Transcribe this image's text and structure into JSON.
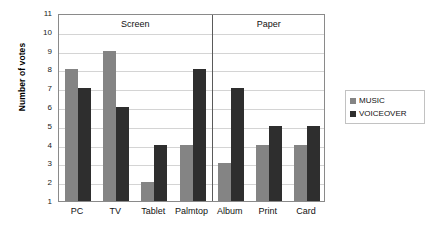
{
  "chart_data": {
    "type": "bar",
    "title": "",
    "xlabel": "",
    "ylabel": "Number of votes",
    "ylim": [
      1,
      11
    ],
    "ytick_step": 1,
    "yticks": [
      11,
      10,
      9,
      8,
      7,
      6,
      5,
      4,
      3,
      2,
      1
    ],
    "grid": true,
    "legend_position": "right",
    "categories": [
      "PC",
      "TV",
      "Tablet",
      "Palmtop",
      "Album",
      "Print",
      "Card"
    ],
    "groups": [
      {
        "label": "Screen",
        "categories": [
          "PC",
          "TV",
          "Tablet",
          "Palmtop"
        ]
      },
      {
        "label": "Paper",
        "categories": [
          "Album",
          "Print",
          "Card"
        ]
      }
    ],
    "series": [
      {
        "name": "MUSIC",
        "color": "#848484",
        "values": [
          8,
          9,
          2,
          4,
          3,
          4,
          4
        ]
      },
      {
        "name": "VOICEOVER",
        "color": "#2e2e2e",
        "values": [
          7,
          6,
          4,
          8,
          7,
          5,
          5
        ]
      }
    ]
  },
  "legend": {
    "entries": [
      {
        "label": "MUSIC",
        "swatch": "music"
      },
      {
        "label": "VOICEOVER",
        "swatch": "voiceover"
      }
    ]
  }
}
